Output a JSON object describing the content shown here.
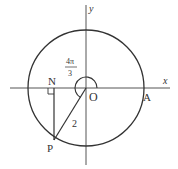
{
  "diagram": {
    "axes": {
      "x_label": "x",
      "y_label": "y"
    },
    "points": {
      "origin": "O",
      "a": "A",
      "n": "N",
      "p": "P"
    },
    "angle": {
      "numerator": "4π",
      "denominator": "3"
    },
    "radius_label": "2",
    "colors": {
      "stroke": "#333333",
      "background": "#ffffff"
    }
  }
}
